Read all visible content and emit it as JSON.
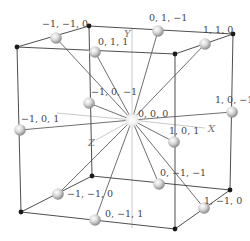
{
  "diagram": {
    "type": "cube-lattice",
    "axes": {
      "x_label": "X",
      "y_label": "Y",
      "z_label": "Z"
    },
    "center": {
      "label": "0, 0, 0",
      "x": 132,
      "y": 120
    },
    "corners": [
      {
        "x": 17,
        "y": 47
      },
      {
        "x": 89,
        "y": 26
      },
      {
        "x": 233,
        "y": 34
      },
      {
        "x": 175,
        "y": 54
      },
      {
        "x": 21,
        "y": 212
      },
      {
        "x": 92,
        "y": 176
      },
      {
        "x": 230,
        "y": 190
      },
      {
        "x": 175,
        "y": 229
      }
    ],
    "atoms": [
      {
        "label": "−1, −1, 0",
        "x": 56,
        "y": 38,
        "lx": 42,
        "ly": 27
      },
      {
        "label": "0, 1, 1",
        "x": 95,
        "y": 52,
        "lx": 98,
        "ly": 45
      },
      {
        "label": "0, 1, −1",
        "x": 158,
        "y": 31,
        "lx": 149,
        "ly": 21
      },
      {
        "label": "1, 1, 0",
        "x": 205,
        "y": 44,
        "lx": 203,
        "ly": 33
      },
      {
        "label": "−1, 0, −1",
        "x": 89,
        "y": 103,
        "lx": 91,
        "ly": 95
      },
      {
        "label": "−1, 0, 1",
        "x": 20,
        "y": 130,
        "lx": 21,
        "ly": 122
      },
      {
        "label": "1, 0, −1",
        "x": 232,
        "y": 112,
        "lx": 215,
        "ly": 103
      },
      {
        "label": "1, 0, 1",
        "x": 174,
        "y": 142,
        "lx": 169,
        "ly": 134
      },
      {
        "label": "−1, −1, 0",
        "x": 58,
        "y": 194,
        "lx": 67,
        "ly": 197
      },
      {
        "label": "0, −1, 1",
        "x": 95,
        "y": 220,
        "lx": 105,
        "ly": 217
      },
      {
        "label": "0, −1, −1",
        "x": 159,
        "y": 184,
        "lx": 160,
        "ly": 176
      },
      {
        "label": "1, −1, 0",
        "x": 204,
        "y": 208,
        "lx": 204,
        "ly": 204
      }
    ],
    "colors": {
      "edge": "#3a3a3a",
      "ray": "#4a4a4a",
      "axis": "#bdbdbd",
      "corner": "#1a1a1a",
      "sphere_light": "#f4f4f4",
      "sphere_dark": "#8a8a8a",
      "label": "#444444"
    }
  }
}
